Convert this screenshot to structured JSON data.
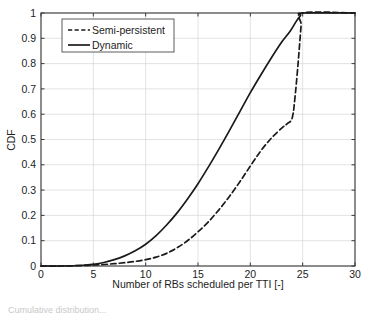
{
  "figure": {
    "background_color": "#ffffff",
    "axis_color": "#3a3a3a",
    "grid_color": "#d7d7d7",
    "curve_color": "#1a1a1a"
  },
  "caption": {
    "text": "Cumulative distribution..."
  },
  "chart_data": {
    "type": "line",
    "title": "",
    "subtitle": "",
    "xlabel": "Number of RBs scheduled per TTI [-]",
    "ylabel": "CDF",
    "xlim": [
      0,
      30
    ],
    "ylim": [
      0,
      1
    ],
    "xticks": [
      0,
      5,
      10,
      15,
      20,
      25,
      30
    ],
    "xticklabels": [
      "0",
      "5",
      "10",
      "15",
      "20",
      "25",
      "30"
    ],
    "yticks": [
      0,
      0.1,
      0.2,
      0.3,
      0.4,
      0.5,
      0.6,
      0.7,
      0.8,
      0.9,
      1
    ],
    "yticklabels": [
      "0",
      "0.1",
      "0.2",
      "0.3",
      "0.4",
      "0.5",
      "0.6",
      "0.7",
      "0.8",
      "0.9",
      "1"
    ],
    "grid": true,
    "legend_position": "upper left",
    "series": [
      {
        "name": "Semi-persistent",
        "style": "dashed",
        "color": "#1a1a1a",
        "x": [
          0,
          2,
          4,
          5,
          6,
          7,
          8,
          9,
          10,
          11,
          12,
          13,
          14,
          15,
          16,
          17,
          18,
          19,
          20,
          21,
          22,
          23,
          23.5,
          24,
          24.3,
          24.6,
          24.85,
          25,
          30
        ],
        "y": [
          0,
          0,
          0.002,
          0.004,
          0.006,
          0.009,
          0.013,
          0.018,
          0.025,
          0.035,
          0.05,
          0.072,
          0.1,
          0.135,
          0.175,
          0.222,
          0.275,
          0.333,
          0.395,
          0.455,
          0.505,
          0.545,
          0.562,
          0.585,
          0.68,
          0.82,
          0.95,
          1.0,
          1.0
        ]
      },
      {
        "name": "Dynamic",
        "style": "solid",
        "color": "#1a1a1a",
        "x": [
          0,
          2,
          4,
          5,
          6,
          7,
          8,
          9,
          10,
          11,
          12,
          13,
          14,
          15,
          16,
          17,
          18,
          19,
          20,
          21,
          22,
          23,
          23.8,
          24.4,
          24.8,
          25,
          30
        ],
        "y": [
          0,
          0,
          0.003,
          0.007,
          0.014,
          0.025,
          0.04,
          0.06,
          0.086,
          0.12,
          0.162,
          0.21,
          0.265,
          0.325,
          0.392,
          0.462,
          0.535,
          0.61,
          0.685,
          0.755,
          0.822,
          0.885,
          0.928,
          0.968,
          0.99,
          1.0,
          1.0
        ]
      }
    ]
  },
  "legend": {
    "entries": [
      {
        "label": "Semi-persistent",
        "style": "dashed"
      },
      {
        "label": "Dynamic",
        "style": "solid"
      }
    ]
  }
}
